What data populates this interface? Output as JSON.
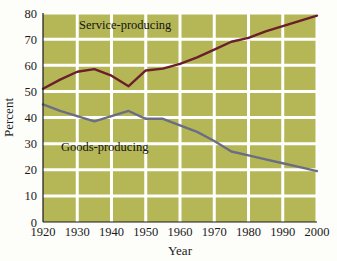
{
  "chart_data": {
    "type": "line",
    "title": "",
    "subtitle": "",
    "xlabel": "Year",
    "ylabel": "Percent",
    "xlim": [
      1920,
      2000
    ],
    "ylim": [
      0,
      80
    ],
    "grid": true,
    "legend_position": "inline-annotation",
    "x_ticks": [
      "1920",
      "1930",
      "1940",
      "1950",
      "1960",
      "1970",
      "1980",
      "1990",
      "2000"
    ],
    "y_ticks": [
      "0",
      "10",
      "20",
      "30",
      "40",
      "50",
      "60",
      "70",
      "80"
    ],
    "x": [
      1920,
      1925,
      1930,
      1935,
      1940,
      1945,
      1950,
      1955,
      1960,
      1965,
      1970,
      1975,
      1980,
      1985,
      1990,
      1995,
      2000
    ],
    "series": [
      {
        "name": "Service-producing",
        "color": "#6b1f2a",
        "values": [
          51.0,
          54.5,
          57.5,
          58.5,
          56.0,
          52.0,
          58.0,
          58.7,
          60.5,
          63.0,
          66.0,
          69.0,
          70.5,
          73.0,
          75.0,
          77.0,
          79.0
        ]
      },
      {
        "name": "Goods-producing",
        "color": "#6b6e82",
        "values": [
          45.0,
          42.5,
          40.5,
          38.5,
          40.5,
          42.5,
          39.5,
          39.5,
          37.0,
          34.5,
          31.0,
          27.0,
          25.5,
          24.0,
          22.5,
          21.0,
          19.5
        ]
      }
    ],
    "annotations": [
      {
        "text": "Service-producing",
        "x": 1944,
        "y": 74
      },
      {
        "text": "Goods-producing",
        "x": 1938,
        "y": 27
      }
    ],
    "plot_background_color": "#b5b757",
    "gridline_color": "#ffffff",
    "page_background_color": "#fdfdfa"
  }
}
